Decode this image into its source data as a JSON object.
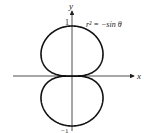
{
  "figure": {
    "equation_label": "r² = −sin θ",
    "x_axis_label": "x",
    "y_axis_label": "y",
    "tick_top": "1",
    "tick_bottom": "−1",
    "curve_color": "#111111",
    "axis_color": "#222222"
  }
}
